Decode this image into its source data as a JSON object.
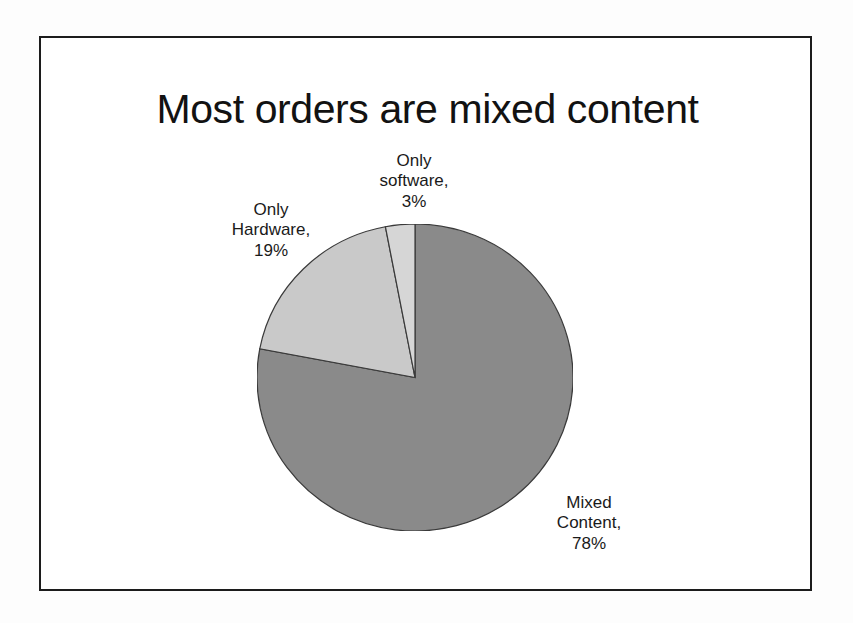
{
  "slide": {
    "title": "Most orders are mixed content",
    "background_color": "#ffffff",
    "frame_color": "#1c1c1c"
  },
  "chart_data": {
    "type": "pie",
    "title": "Most orders are mixed content",
    "xlabel": "",
    "ylabel": "",
    "legend_position": "none",
    "grid": false,
    "value_unit": "percent",
    "start_angle_deg": 0,
    "direction": "clockwise",
    "categories": [
      "Mixed Content",
      "Only Hardware",
      "Only software"
    ],
    "values": [
      78,
      19,
      3
    ],
    "colors": [
      "#8a8a8a",
      "#c9c9c9",
      "#d6d6d6"
    ],
    "slice_border_color": "#3a3a3a",
    "slices": [
      {
        "name": "Mixed Content",
        "value": 78,
        "value_label": "78%",
        "color": "#8a8a8a",
        "label_lines": [
          "Mixed",
          "Content,",
          "78%"
        ]
      },
      {
        "name": "Only Hardware",
        "value": 19,
        "value_label": "19%",
        "color": "#c9c9c9",
        "label_lines": [
          "Only",
          "Hardware,",
          "19%"
        ]
      },
      {
        "name": "Only software",
        "value": 3,
        "value_label": "3%",
        "color": "#d6d6d6",
        "label_lines": [
          "Only",
          "software,",
          "3%"
        ]
      }
    ]
  },
  "labels": {
    "only_software": {
      "line1": "Only",
      "line2": "software,",
      "line3": "3%"
    },
    "only_hardware": {
      "line1": "Only",
      "line2": "Hardware,",
      "line3": "19%"
    },
    "mixed_content": {
      "line1": "Mixed",
      "line2": "Content,",
      "line3": "78%"
    }
  }
}
